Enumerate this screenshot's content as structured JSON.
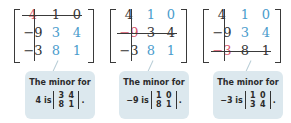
{
  "colors": {
    "deleted": "#d6566a",
    "minor": "#4a9ccc",
    "text": "#333333",
    "callout_bg": "#dce8ee"
  },
  "panels": [
    {
      "matrix": [
        [
          "4",
          "1",
          "0"
        ],
        [
          "-9",
          "3",
          "4"
        ],
        [
          "-3",
          "8",
          "1"
        ]
      ],
      "deleted_row": 0,
      "deleted_col": 0,
      "callout": {
        "line1": "The minor for",
        "element": "4 is",
        "minor": [
          "3",
          "4",
          "8",
          "1"
        ],
        "end": "."
      }
    },
    {
      "matrix": [
        [
          "4",
          "1",
          "0"
        ],
        [
          "-9",
          "3",
          "4"
        ],
        [
          "-3",
          "8",
          "1"
        ]
      ],
      "deleted_row": 1,
      "deleted_col": 0,
      "callout": {
        "line1": "The minor for",
        "element": "−9 is",
        "minor": [
          "1",
          "0",
          "8",
          "1"
        ],
        "end": "."
      }
    },
    {
      "matrix": [
        [
          "4",
          "1",
          "0"
        ],
        [
          "-9",
          "3",
          "4"
        ],
        [
          "-3",
          "8",
          "1"
        ]
      ],
      "deleted_row": 2,
      "deleted_col": 0,
      "callout": {
        "line1": "The minor for",
        "element": "−3 is",
        "minor": [
          "1",
          "0",
          "3",
          "4"
        ],
        "end": "."
      }
    }
  ],
  "cells_display": {
    "p0": [
      "4",
      "1",
      "0",
      "−9",
      "3",
      "4",
      "−3",
      "8",
      "1"
    ],
    "p1": [
      "4",
      "1",
      "0",
      "−9",
      "3",
      "4",
      "−3",
      "8",
      "1"
    ],
    "p2": [
      "4",
      "1",
      "0",
      "−9",
      "3",
      "4",
      "−3",
      "8",
      "1"
    ]
  }
}
